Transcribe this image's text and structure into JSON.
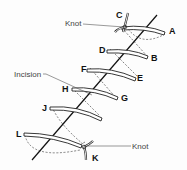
{
  "diagram": {
    "type": "suture-technique",
    "labels": {
      "knot_top": "Knot",
      "knot_bottom": "Knot",
      "incision": "Incision",
      "points": [
        "A",
        "B",
        "C",
        "D",
        "E",
        "F",
        "G",
        "H",
        "J",
        "K",
        "L"
      ]
    },
    "points": {
      "A": "A",
      "B": "B",
      "C": "C",
      "D": "D",
      "E": "E",
      "F": "F",
      "G": "G",
      "H": "H",
      "J": "J",
      "K": "K",
      "L": "L"
    },
    "colors": {
      "line": "#222222",
      "label": "#111111",
      "callout": "#444444"
    }
  }
}
